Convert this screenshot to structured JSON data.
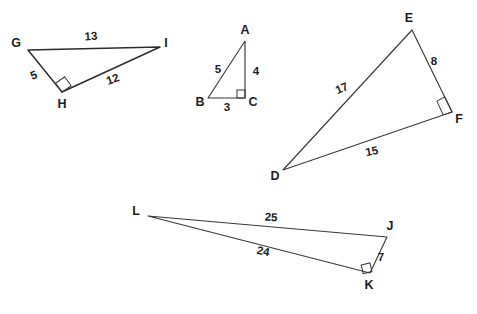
{
  "canvas": {
    "width": 477,
    "height": 314,
    "background": "#ffffff",
    "stroke_color": "#3a3a3a",
    "text_color": "#1d1d1d"
  },
  "figure": {
    "kind": "geometry-diagram"
  },
  "triangles": [
    {
      "id": "GHI",
      "name": "triangle-ghi",
      "vertices": [
        {
          "label": "G",
          "x": 28,
          "y": 50,
          "label_x": 16,
          "label_y": 44
        },
        {
          "label": "I",
          "x": 160,
          "y": 47,
          "label_x": 166,
          "label_y": 44
        },
        {
          "label": "H",
          "x": 62,
          "y": 92,
          "label_x": 62,
          "label_y": 105
        }
      ],
      "sides": [
        {
          "label": "13",
          "from": "G",
          "to": "I",
          "x": 91,
          "y": 37,
          "rotate": -4
        },
        {
          "label": "5",
          "from": "G",
          "to": "H",
          "x": 34,
          "y": 76,
          "rotate": -22
        },
        {
          "label": "12",
          "from": "H",
          "to": "I",
          "x": 113,
          "y": 80,
          "rotate": -20
        }
      ],
      "right_angle": {
        "at": "H",
        "x": 62,
        "y": 92,
        "size": 9,
        "rotate": -22
      }
    },
    {
      "id": "ABC",
      "name": "triangle-abc",
      "vertices": [
        {
          "label": "A",
          "x": 245,
          "y": 41,
          "label_x": 245,
          "label_y": 31
        },
        {
          "label": "B",
          "x": 208,
          "y": 98,
          "label_x": 200,
          "label_y": 103
        },
        {
          "label": "C",
          "x": 245,
          "y": 98,
          "label_x": 253,
          "label_y": 103
        }
      ],
      "sides": [
        {
          "label": "5",
          "from": "A",
          "to": "B",
          "x": 218,
          "y": 70,
          "rotate": 0
        },
        {
          "label": "4",
          "from": "A",
          "to": "C",
          "x": 256,
          "y": 72,
          "rotate": 0
        },
        {
          "label": "3",
          "from": "B",
          "to": "C",
          "x": 227,
          "y": 108,
          "rotate": 0
        }
      ],
      "right_angle": {
        "at": "C",
        "x": 245,
        "y": 98,
        "size": 8,
        "rotate": 0
      }
    },
    {
      "id": "DEF",
      "name": "triangle-def",
      "vertices": [
        {
          "label": "E",
          "x": 412,
          "y": 30,
          "label_x": 409,
          "label_y": 19
        },
        {
          "label": "F",
          "x": 452,
          "y": 112,
          "label_x": 459,
          "label_y": 120
        },
        {
          "label": "D",
          "x": 283,
          "y": 170,
          "label_x": 275,
          "label_y": 177
        }
      ],
      "sides": [
        {
          "label": "17",
          "from": "D",
          "to": "E",
          "x": 342,
          "y": 89,
          "rotate": -24
        },
        {
          "label": "8",
          "from": "E",
          "to": "F",
          "x": 434,
          "y": 62,
          "rotate": 0
        },
        {
          "label": "15",
          "from": "D",
          "to": "F",
          "x": 372,
          "y": 152,
          "rotate": -11
        }
      ],
      "right_angle": {
        "at": "F",
        "x": 452,
        "y": 112,
        "size": 9,
        "rotate": 24
      }
    },
    {
      "id": "JKL",
      "name": "triangle-jkl",
      "vertices": [
        {
          "label": "L",
          "x": 148,
          "y": 216,
          "label_x": 136,
          "label_y": 212
        },
        {
          "label": "J",
          "x": 387,
          "y": 237,
          "label_x": 390,
          "label_y": 227
        },
        {
          "label": "K",
          "x": 370,
          "y": 273,
          "label_x": 369,
          "label_y": 286
        }
      ],
      "sides": [
        {
          "label": "25",
          "from": "L",
          "to": "J",
          "x": 271,
          "y": 218,
          "rotate": 4
        },
        {
          "label": "7",
          "from": "J",
          "to": "K",
          "x": 381,
          "y": 258,
          "rotate": 0
        },
        {
          "label": "24",
          "from": "L",
          "to": "K",
          "x": 263,
          "y": 252,
          "rotate": 11
        }
      ],
      "right_angle": {
        "at": "K",
        "x": 370,
        "y": 273,
        "size": 9,
        "rotate": -13
      }
    }
  ]
}
